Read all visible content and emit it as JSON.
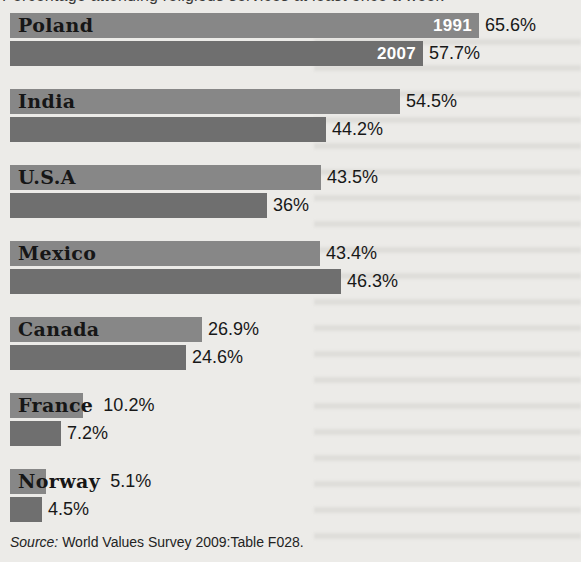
{
  "page": {
    "title_partial": "Percentage attending religious services at least once a week",
    "source": {
      "prefix": "Source:",
      "text": " World Values Survey 2009:Table F028."
    }
  },
  "chart_data": {
    "type": "bar",
    "orientation": "horizontal",
    "categories": [
      "Poland",
      "India",
      "U.S.A",
      "Mexico",
      "Canada",
      "France",
      "Norway"
    ],
    "series": [
      {
        "name": "1991",
        "color": "#878787",
        "values": [
          65.6,
          54.5,
          43.5,
          43.4,
          26.9,
          10.2,
          5.1
        ],
        "labels": [
          "65.6%",
          "54.5%",
          "43.5%",
          "43.4%",
          "26.9%",
          "10.2%",
          "5.1%"
        ]
      },
      {
        "name": "2007",
        "color": "#6f6f6f",
        "values": [
          57.7,
          44.2,
          36,
          46.3,
          24.6,
          7.2,
          4.5
        ],
        "labels": [
          "57.7%",
          "44.2%",
          "36%",
          "46.3%",
          "24.6%",
          "7.2%",
          "4.5%"
        ]
      }
    ],
    "legend": "Year labels 1991 and 2007 shown in white inside the Poland bars only",
    "unit": "%",
    "xlim": [
      0,
      70
    ],
    "px_per_percent": 7.15,
    "bar_height_px": 25,
    "grid": false,
    "source": "World Values Survey 2009:Table F028."
  }
}
